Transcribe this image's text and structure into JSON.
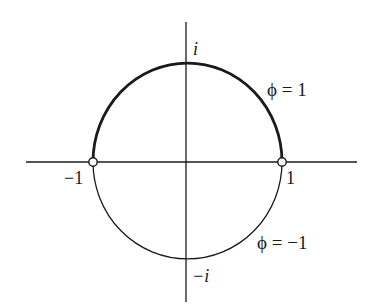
{
  "diagram": {
    "axes": {
      "horizontal": {
        "x1": 26,
        "x2": 357,
        "y": 162
      },
      "vertical": {
        "x": 186,
        "y1": 22,
        "y2": 302
      }
    },
    "circle": {
      "cx": 187.5,
      "cy": 161,
      "rx": 94.5,
      "ry": 97
    },
    "labels": {
      "pos_i": "i",
      "neg_i": "−i",
      "neg_one": "−1",
      "pos_one": "1",
      "upper_arc": "ϕ = 1",
      "lower_arc": "ϕ = −1"
    },
    "points": [
      {
        "name": "minus-one-point",
        "x": 93,
        "y": 162
      },
      {
        "name": "plus-one-point",
        "x": 282,
        "y": 162
      }
    ],
    "colors": {
      "stroke": "#1a1a1a",
      "background": "#ffffff"
    }
  }
}
